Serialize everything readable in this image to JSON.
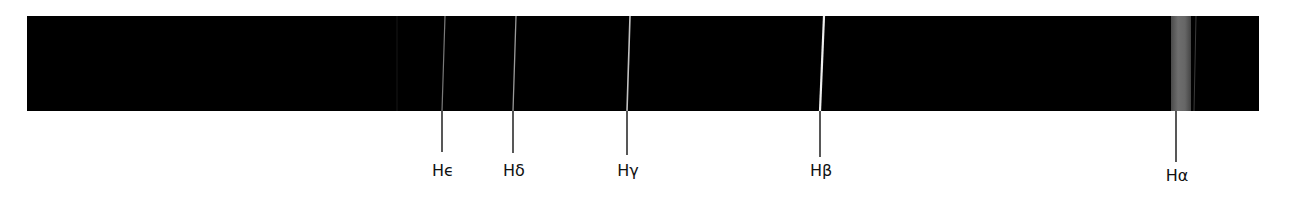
{
  "figure": {
    "background": "#ffffff",
    "band": {
      "x": 27,
      "y": 16,
      "width": 1232,
      "height": 95,
      "color": "#000000"
    },
    "lines": [
      {
        "id": "faint-397",
        "x_top": 397,
        "x_bottom": 397,
        "width": 1,
        "color": "#161616",
        "label": null
      },
      {
        "id": "h-epsilon",
        "x_top": 445,
        "x_bottom": 442,
        "width": 1.2,
        "color": "#7a7a7a",
        "label": "Hϵ",
        "label_base": "H",
        "label_greek": "ϵ",
        "tick_end": 152
      },
      {
        "id": "h-delta",
        "x_top": 516,
        "x_bottom": 513,
        "width": 1.3,
        "color": "#9a9a9a",
        "label": "Hδ",
        "label_base": "H",
        "label_greek": "δ",
        "tick_end": 153
      },
      {
        "id": "h-gamma",
        "x_top": 630,
        "x_bottom": 627,
        "width": 1.6,
        "color": "#c2c2c2",
        "label": "Hγ",
        "label_base": "H",
        "label_greek": "γ",
        "tick_end": 155
      },
      {
        "id": "h-beta",
        "x_top": 824,
        "x_bottom": 820,
        "width": 2.2,
        "color": "#eeeeee",
        "label": "Hβ",
        "label_base": "H",
        "label_greek": "β",
        "tick_end": 157
      },
      {
        "id": "faint-1195",
        "x_top": 1196,
        "x_bottom": 1194,
        "width": 1,
        "color": "#3a3a3a",
        "label": null
      }
    ],
    "broad_band": {
      "id": "h-alpha",
      "x": 1171,
      "width": 20,
      "color_center": "#6e6e6e",
      "color_edge": "#4a4a4a",
      "label": "Hα",
      "label_base": "H",
      "label_greek": "α",
      "tick_x": 1176,
      "tick_end": 162
    },
    "tick_color": "#111111",
    "tick_width": 1.4,
    "label_y": 176
  },
  "labels": {
    "h_epsilon": "Hϵ",
    "h_delta": "Hδ",
    "h_gamma": "Hγ",
    "h_beta": "Hβ",
    "h_alpha": "Hα"
  }
}
